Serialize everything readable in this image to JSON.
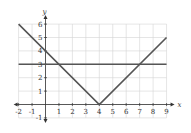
{
  "chart_data": {
    "type": "line",
    "title": "",
    "xlabel": "x",
    "ylabel": "y",
    "xlim": [
      -2,
      9
    ],
    "ylim": [
      -1,
      6
    ],
    "grid": true,
    "x_ticks": [
      -2,
      -1,
      1,
      2,
      3,
      4,
      5,
      6,
      7,
      8,
      9
    ],
    "y_ticks": [
      -1,
      1,
      2,
      3,
      4,
      5,
      6
    ],
    "x_tick_labels": [
      "-2",
      "-1",
      "1",
      "2",
      "3",
      "4",
      "5",
      "6",
      "7",
      "8",
      "9"
    ],
    "y_tick_labels": [
      "-1",
      "1",
      "2",
      "3",
      "4",
      "5",
      "6"
    ],
    "series": [
      {
        "name": "y = |x - 4|",
        "x": [
          -2,
          4,
          9
        ],
        "y": [
          6,
          0,
          5
        ],
        "color": "#555555"
      },
      {
        "name": "y = 3",
        "x": [
          -2,
          9
        ],
        "y": [
          3,
          3
        ],
        "color": "#555555"
      }
    ],
    "colors": {
      "grid": "#d4d4d4",
      "axis": "#333333"
    }
  }
}
